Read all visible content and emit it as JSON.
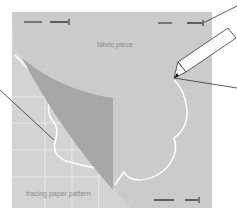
{
  "diagram": {
    "labels": {
      "fabric": "fabric piece",
      "pattern": "tracing paper pattern"
    },
    "elements": [
      "fabric-piece",
      "tracing-paper-pattern",
      "folded-corner",
      "flower-outline",
      "pencil",
      "pins",
      "leader-lines"
    ],
    "colors": {
      "background": "#ffffff",
      "fabric": "#cccccc",
      "tracing_paper": "#d3d3d3",
      "fold": "#a9a9a9",
      "outline": "#ffffff",
      "grid": "#e6e6e6",
      "ink": "#222222",
      "label_text": "#8a8a8a"
    }
  }
}
